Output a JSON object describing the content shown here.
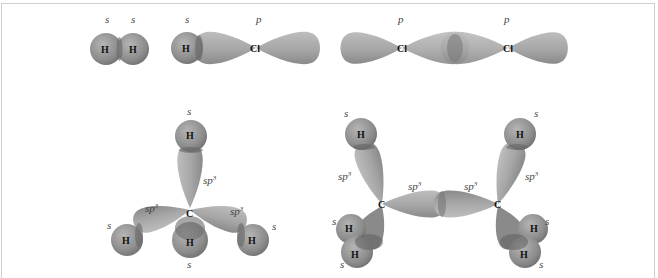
{
  "figure": {
    "panels": [
      {
        "id": "H2",
        "atoms": [
          "H",
          "H"
        ],
        "orbital_labels": [
          "s",
          "s"
        ]
      },
      {
        "id": "HCl",
        "atoms": [
          "H",
          "Cl"
        ],
        "orbital_labels": [
          "s",
          "p"
        ]
      },
      {
        "id": "Cl2",
        "atoms": [
          "Cl",
          "Cl"
        ],
        "orbital_labels": [
          "p",
          "p"
        ]
      },
      {
        "id": "CH4",
        "atoms": [
          "C",
          "H",
          "H",
          "H",
          "H"
        ],
        "orbital_labels": [
          "s",
          "sp3",
          "sp3",
          "sp3",
          "s",
          "s",
          "s"
        ]
      },
      {
        "id": "C2H6",
        "atoms": [
          "C",
          "C",
          "H",
          "H",
          "H",
          "H",
          "H",
          "H"
        ],
        "orbital_labels": [
          "s",
          "sp3",
          "sp3",
          "sp3",
          "sp3",
          "s",
          "s",
          "s",
          "s",
          "s"
        ]
      }
    ],
    "labels": {
      "s": "s",
      "p": "p",
      "sp": "sp",
      "sup3": "3",
      "H": "H",
      "Cl": "Cl",
      "C": "C"
    },
    "colors": {
      "sphere": "#8f8f8f",
      "lobe": "#a9a9a9",
      "overlap": "#6e6e6e",
      "border": "#cfcfcf"
    }
  }
}
